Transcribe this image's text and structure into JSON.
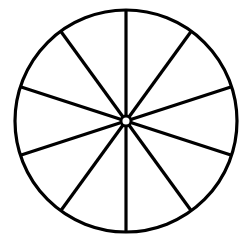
{
  "diagram": {
    "type": "divided-circle",
    "sector_count": 10,
    "center": [
      126,
      121
    ],
    "radius": 111,
    "hub_radius": 5,
    "stroke_color": "#000000",
    "fill_color": "#ffffff",
    "stroke_width": 3.2
  }
}
